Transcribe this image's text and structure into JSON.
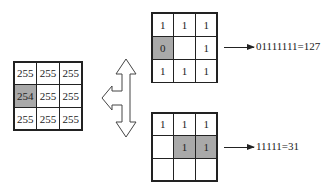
{
  "left_grid": {
    "cells": [
      "255",
      "255",
      "255",
      "254",
      "255",
      "255",
      "255",
      "255",
      "255"
    ],
    "shaded": [
      3
    ]
  },
  "top_grid": {
    "cells": [
      "1",
      "1",
      "1",
      "0",
      "",
      "1",
      "1",
      "1",
      "1"
    ],
    "shaded": [
      3
    ],
    "result": "01111111=127"
  },
  "bottom_grid": {
    "cells": [
      "1",
      "1",
      "1",
      "",
      "1",
      "1",
      "",
      "",
      ""
    ],
    "shaded": [
      4,
      5
    ],
    "result": "11111=31"
  },
  "colors": {
    "shade": "#a9a9a9",
    "line": "#222222"
  }
}
